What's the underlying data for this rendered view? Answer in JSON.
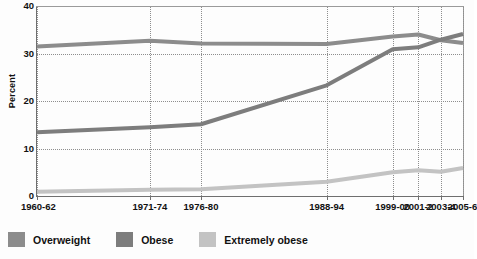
{
  "chart_data": {
    "type": "line",
    "title": "",
    "xlabel": "",
    "ylabel": "Percent",
    "categories": [
      "1960-62",
      "1971-74",
      "1976-80",
      "1988-94",
      "1999-00",
      "2001-2",
      "2003-4",
      "2005-6"
    ],
    "x_positions_pct": [
      0,
      26.5,
      38.5,
      68.0,
      83.5,
      89.5,
      94.8,
      100
    ],
    "ylim": [
      0,
      40
    ],
    "yticks": [
      0,
      10,
      20,
      30,
      40
    ],
    "grid": "dotted both axes",
    "legend_position": "bottom-left",
    "series": [
      {
        "name": "Overweight",
        "color": "#8c8c8c",
        "values": [
          31.5,
          32.7,
          32.1,
          32.0,
          33.6,
          34.0,
          32.8,
          32.2
        ]
      },
      {
        "name": "Obese",
        "color": "#7d7d7d",
        "values": [
          13.4,
          14.5,
          15.1,
          23.3,
          30.9,
          31.3,
          32.9,
          34.1
        ]
      },
      {
        "name": "Extremely obese",
        "color": "#c3c3c3",
        "values": [
          0.9,
          1.3,
          1.4,
          3.0,
          5.0,
          5.4,
          5.1,
          5.9
        ]
      }
    ]
  },
  "axis": {
    "y_title": "Percent",
    "y_tick_labels": [
      "0",
      "10",
      "20",
      "30",
      "40"
    ],
    "x_tick_labels": [
      "1960-62",
      "1971-74",
      "1976-80",
      "1988-94",
      "1999-00",
      "2001-2",
      "2003-4",
      "2005-6"
    ]
  },
  "legend": {
    "items": [
      {
        "label": "Overweight",
        "color": "#8c8c8c"
      },
      {
        "label": "Obese",
        "color": "#7d7d7d"
      },
      {
        "label": "Extremely obese",
        "color": "#c3c3c3"
      }
    ]
  }
}
